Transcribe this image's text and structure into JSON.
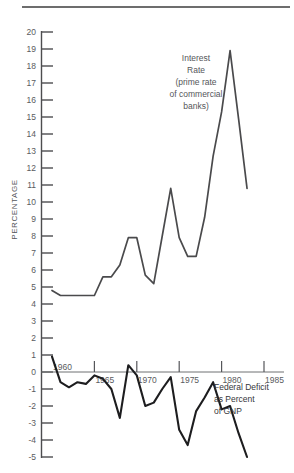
{
  "chart_data": {
    "type": "line",
    "title": "",
    "xlabel": "",
    "ylabel": "PERCENTAGE",
    "ylim": [
      -5,
      20
    ],
    "xlim": [
      1959,
      1986
    ],
    "grid": false,
    "legend": "inline-annotations",
    "y_ticks": [
      20,
      19,
      18,
      17,
      16,
      15,
      14,
      13,
      12,
      11,
      10,
      9,
      8,
      7,
      6,
      5,
      4,
      3,
      2,
      1,
      0,
      -1,
      -2,
      -3,
      -4,
      -5
    ],
    "y_tick_labels": [
      "20",
      "19",
      "18",
      "17",
      "16",
      "15",
      "14",
      "13",
      "12",
      "11",
      "10",
      "9",
      "8",
      "7",
      "6",
      "5",
      "4",
      "3",
      "2",
      "1",
      "0",
      "-1",
      "-2",
      "-3",
      "-4",
      "-5"
    ],
    "x_ticks": [
      1960,
      1965,
      1970,
      1975,
      1980,
      1985
    ],
    "x_tick_labels": [
      "1960",
      "1965",
      "1970",
      "1975",
      "1980",
      "1985"
    ],
    "series": [
      {
        "name": "Interest Rate",
        "annotation": [
          "Interest",
          "Rate",
          "(prime rate",
          "of commercial",
          "banks)"
        ],
        "color": "#4a4a4c",
        "x": [
          1960,
          1961,
          1962,
          1963,
          1964,
          1965,
          1966,
          1967,
          1968,
          1969,
          1970,
          1971,
          1972,
          1973,
          1974,
          1975,
          1976,
          1977,
          1978,
          1979,
          1980,
          1981,
          1982,
          1983
        ],
        "values": [
          4.8,
          4.5,
          4.5,
          4.5,
          4.5,
          4.5,
          5.6,
          5.6,
          6.3,
          7.9,
          7.9,
          5.7,
          5.2,
          8.0,
          10.8,
          7.9,
          6.8,
          6.8,
          9.1,
          12.7,
          15.3,
          18.9,
          14.9,
          10.8
        ]
      },
      {
        "name": "Federal Deficit as Percent of GNP",
        "annotation": [
          "Federal Deficit",
          "as Percent",
          "of GNP"
        ],
        "color": "#1d1d1f",
        "x": [
          1960,
          1961,
          1962,
          1963,
          1964,
          1965,
          1966,
          1967,
          1968,
          1969,
          1970,
          1971,
          1972,
          1973,
          1974,
          1975,
          1976,
          1977,
          1978,
          1979,
          1980,
          1981,
          1982,
          1983
        ],
        "values": [
          0.9,
          -0.6,
          -0.9,
          -0.6,
          -0.7,
          -0.2,
          -0.4,
          -1.0,
          -2.7,
          0.4,
          -0.2,
          -2.0,
          -1.8,
          -1.0,
          -0.3,
          -3.4,
          -4.3,
          -2.3,
          -1.5,
          -0.6,
          -2.2,
          -2.0,
          -3.6,
          -5.0
        ]
      }
    ]
  },
  "axis_title": "PERCENTAGE",
  "annotations": {
    "interest": [
      "Interest",
      "Rate",
      "(prime rate",
      "of commercial",
      "banks)"
    ],
    "deficit": [
      "Federal Deficit",
      "as Percent",
      "of GNP"
    ]
  }
}
